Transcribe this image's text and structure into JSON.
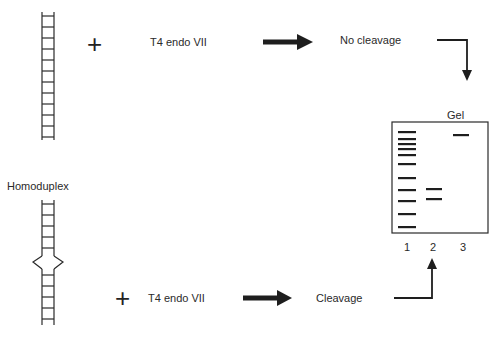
{
  "diagram": {
    "top_row": {
      "substrate": "homoduplex-dna-ladder",
      "operator": "+",
      "enzyme_label": "T4 endo VII",
      "result_label": "No cleavage"
    },
    "middle_label": "Homoduplex",
    "bottom_row": {
      "substrate": "heteroduplex-dna-with-bubble",
      "operator": "+",
      "enzyme_label": "T4 endo VII",
      "result_label": "Cleavage"
    },
    "gel": {
      "title": "Gel",
      "lanes": [
        {
          "label": "1",
          "type": "marker",
          "band_y": [
            132,
            139,
            144,
            149,
            155,
            164,
            178,
            190,
            201,
            214,
            226
          ]
        },
        {
          "label": "2",
          "type": "cleaved",
          "band_y": [
            189,
            199
          ]
        },
        {
          "label": "3",
          "type": "uncleaved",
          "band_y": [
            135
          ]
        }
      ]
    },
    "colors": {
      "ink": "#1e1e1e",
      "background": "#ffffff"
    }
  }
}
